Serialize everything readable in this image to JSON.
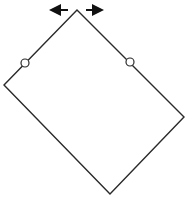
{
  "diagram": {
    "title": "",
    "colors": {
      "stroke": "#2a2a2a",
      "arrow": "#111111",
      "circle_fill": "#ffffff",
      "background": "#ffffff"
    },
    "shapes": [
      {
        "id": "rectangle",
        "type": "quadrilateral",
        "label": ""
      },
      {
        "id": "hinge-left",
        "type": "circle",
        "label": ""
      },
      {
        "id": "hinge-right",
        "type": "circle",
        "label": ""
      },
      {
        "id": "arrow-left",
        "type": "arrow",
        "direction": "left",
        "label": ""
      },
      {
        "id": "arrow-right",
        "type": "arrow",
        "direction": "right",
        "label": ""
      }
    ]
  }
}
